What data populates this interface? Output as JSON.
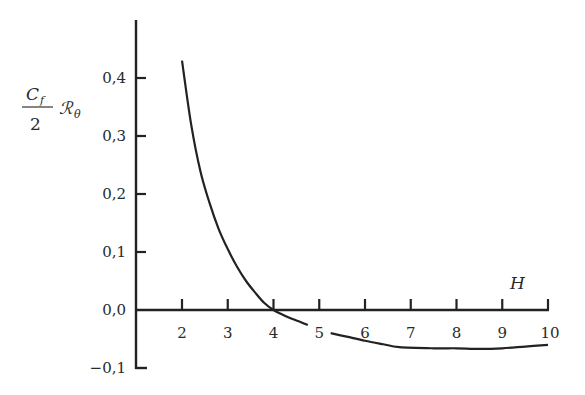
{
  "chart_data": {
    "type": "line",
    "title": "",
    "xlabel": "H",
    "ylabel": "C_f/2 · R_θ",
    "ylabel_parts": {
      "numerator": "C",
      "numerator_sub": "f",
      "denominator": "2",
      "factor": "ℛ",
      "factor_sub": "θ"
    },
    "xlim": [
      1,
      10
    ],
    "ylim": [
      -0.1,
      0.45
    ],
    "x_ticks": [
      2,
      3,
      4,
      5,
      6,
      7,
      8,
      9,
      10
    ],
    "x_tick_labels": [
      "2",
      "3",
      "4",
      "5",
      "6",
      "7",
      "8",
      "9",
      "10"
    ],
    "y_ticks": [
      -0.1,
      0.0,
      0.1,
      0.2,
      0.3,
      0.4
    ],
    "y_tick_labels": [
      "−0,1",
      "0,0",
      "0,1",
      "0,2",
      "0,3",
      "0,4"
    ],
    "grid": false,
    "legend": null,
    "series": [
      {
        "name": "C_f/2 R_θ vs H",
        "segments": [
          [
            [
              2.0,
              0.43
            ],
            [
              2.2,
              0.32
            ],
            [
              2.4,
              0.24
            ],
            [
              2.6,
              0.185
            ],
            [
              2.8,
              0.14
            ],
            [
              3.0,
              0.105
            ],
            [
              3.2,
              0.075
            ],
            [
              3.4,
              0.05
            ],
            [
              3.6,
              0.03
            ],
            [
              3.8,
              0.012
            ],
            [
              4.0,
              0.0
            ],
            [
              4.2,
              -0.008
            ],
            [
              4.4,
              -0.015
            ],
            [
              4.6,
              -0.021
            ],
            [
              4.75,
              -0.026
            ]
          ],
          [
            [
              5.25,
              -0.04
            ],
            [
              5.6,
              -0.046
            ],
            [
              6.0,
              -0.053
            ],
            [
              6.4,
              -0.059
            ],
            [
              6.75,
              -0.064
            ],
            [
              7.5,
              -0.066
            ],
            [
              8.0,
              -0.066
            ],
            [
              8.5,
              -0.067
            ],
            [
              9.0,
              -0.066
            ],
            [
              9.5,
              -0.063
            ],
            [
              10.0,
              -0.06
            ]
          ]
        ]
      }
    ]
  }
}
